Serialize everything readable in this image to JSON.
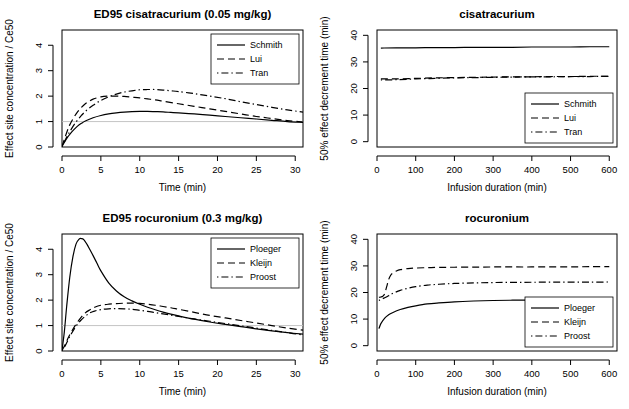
{
  "figure": {
    "width": 629,
    "height": 409,
    "background": "#ffffff",
    "ink": "#000000",
    "refline_color": "#bdbdbd"
  },
  "chart_data": [
    {
      "id": "cisatracurium-concentration",
      "type": "line",
      "title": "ED95 cisatracurium (0.05 mg/kg)",
      "xlabel": "Time (min)",
      "ylabel": "Effect site concentration / Ce50",
      "xlim": [
        0,
        31
      ],
      "ylim": [
        0,
        4.6
      ],
      "xticks": [
        0,
        5,
        10,
        15,
        20,
        25,
        30
      ],
      "yticks": [
        0,
        1,
        2,
        3,
        4
      ],
      "grid": false,
      "reference_line_y": 1,
      "legend_position": "top-right",
      "series": [
        {
          "name": "Schmith",
          "dash": "solid",
          "x": [
            0,
            0.3,
            0.7,
            1,
            1.5,
            2,
            2.5,
            3,
            4,
            5,
            6,
            7,
            8,
            9,
            10,
            11,
            12,
            13,
            14,
            15,
            17,
            19,
            21,
            23,
            25,
            27,
            29,
            31
          ],
          "y": [
            0.02,
            0.18,
            0.38,
            0.5,
            0.67,
            0.82,
            0.93,
            1.02,
            1.15,
            1.24,
            1.3,
            1.34,
            1.37,
            1.39,
            1.4,
            1.4,
            1.39,
            1.38,
            1.36,
            1.34,
            1.3,
            1.25,
            1.2,
            1.15,
            1.1,
            1.05,
            1.0,
            0.97
          ]
        },
        {
          "name": "Lui",
          "dash": "dashed",
          "x": [
            0,
            0.3,
            0.7,
            1,
            1.5,
            2,
            2.5,
            3,
            3.5,
            4,
            5,
            6,
            7,
            8,
            9,
            10,
            11,
            12,
            13,
            15,
            17,
            19,
            21,
            23,
            25,
            27,
            29,
            31
          ],
          "y": [
            0.02,
            0.3,
            0.65,
            0.87,
            1.15,
            1.38,
            1.56,
            1.7,
            1.8,
            1.88,
            1.97,
            2.0,
            2.0,
            1.99,
            1.96,
            1.93,
            1.89,
            1.85,
            1.8,
            1.7,
            1.6,
            1.5,
            1.4,
            1.3,
            1.2,
            1.12,
            1.04,
            0.98
          ]
        },
        {
          "name": "Tran",
          "dash": "dashdot",
          "x": [
            0,
            0.3,
            0.7,
            1,
            1.5,
            2,
            2.5,
            3,
            4,
            5,
            6,
            7,
            8,
            9,
            10,
            11,
            12,
            13,
            14,
            15,
            17,
            19,
            21,
            23,
            25,
            27,
            29,
            31
          ],
          "y": [
            0.02,
            0.2,
            0.45,
            0.6,
            0.85,
            1.06,
            1.24,
            1.4,
            1.64,
            1.83,
            1.97,
            2.08,
            2.16,
            2.21,
            2.25,
            2.26,
            2.26,
            2.24,
            2.21,
            2.18,
            2.1,
            2.0,
            1.9,
            1.78,
            1.67,
            1.56,
            1.46,
            1.37
          ]
        }
      ]
    },
    {
      "id": "cisatracurium-decrement",
      "type": "line",
      "title": "cisatracurium",
      "xlabel": "Infusion duration (min)",
      "ylabel": "50% effect decrement time (min)",
      "xlim": [
        0,
        620
      ],
      "ylim": [
        -2,
        42
      ],
      "xticks": [
        0,
        100,
        200,
        300,
        400,
        500,
        600
      ],
      "yticks": [
        0,
        10,
        20,
        30,
        40
      ],
      "grid": false,
      "legend_position": "bottom-right",
      "series": [
        {
          "name": "Schmith",
          "dash": "solid",
          "x": [
            10,
            50,
            100,
            150,
            200,
            250,
            300,
            350,
            400,
            450,
            500,
            550,
            600
          ],
          "y": [
            35.2,
            35.3,
            35.3,
            35.4,
            35.4,
            35.5,
            35.5,
            35.5,
            35.6,
            35.6,
            35.6,
            35.7,
            35.7
          ]
        },
        {
          "name": "Lui",
          "dash": "dashed",
          "x": [
            10,
            50,
            100,
            150,
            200,
            250,
            300,
            350,
            400,
            450,
            500,
            550,
            600
          ],
          "y": [
            23.6,
            23.6,
            23.8,
            24.0,
            24.1,
            24.2,
            24.3,
            24.4,
            24.4,
            24.5,
            24.5,
            24.6,
            24.6
          ]
        },
        {
          "name": "Tran",
          "dash": "dashdot",
          "x": [
            10,
            50,
            100,
            150,
            200,
            250,
            300,
            350,
            400,
            450,
            500,
            550,
            600
          ],
          "y": [
            23.2,
            23.3,
            23.6,
            23.8,
            24.0,
            24.1,
            24.2,
            24.3,
            24.4,
            24.4,
            24.5,
            24.5,
            24.6
          ]
        }
      ]
    },
    {
      "id": "rocuronium-concentration",
      "type": "line",
      "title": "ED95 rocuronium (0.3 mg/kg)",
      "xlabel": "Time (min)",
      "ylabel": "Effect site concentration / Ce50",
      "xlim": [
        0,
        31
      ],
      "ylim": [
        0,
        4.6
      ],
      "xticks": [
        0,
        5,
        10,
        15,
        20,
        25,
        30
      ],
      "yticks": [
        0,
        1,
        2,
        3,
        4
      ],
      "grid": false,
      "reference_line_y": 1,
      "legend_position": "top-right",
      "series": [
        {
          "name": "Ploeger",
          "dash": "solid",
          "x": [
            0,
            0.3,
            0.6,
            1,
            1.4,
            1.8,
            2.2,
            2.5,
            2.8,
            3.2,
            3.6,
            4,
            4.5,
            5,
            6,
            7,
            8,
            9,
            10,
            11,
            12,
            13,
            14,
            15,
            17,
            19,
            21,
            23,
            25,
            27,
            29,
            31
          ],
          "y": [
            0.02,
            0.75,
            1.75,
            2.9,
            3.7,
            4.2,
            4.4,
            4.42,
            4.38,
            4.2,
            3.98,
            3.75,
            3.45,
            3.15,
            2.68,
            2.36,
            2.13,
            1.97,
            1.84,
            1.72,
            1.62,
            1.53,
            1.45,
            1.38,
            1.25,
            1.14,
            1.05,
            0.96,
            0.87,
            0.79,
            0.72,
            0.66
          ]
        },
        {
          "name": "Kleijn",
          "dash": "dashed",
          "x": [
            0,
            0.4,
            0.8,
            1.2,
            1.8,
            2.4,
            3,
            3.6,
            4.2,
            5,
            6,
            7,
            8,
            9,
            10,
            11,
            12,
            13,
            14,
            15,
            17,
            19,
            21,
            23,
            25,
            27,
            29,
            31
          ],
          "y": [
            0.02,
            0.25,
            0.52,
            0.75,
            1.05,
            1.3,
            1.5,
            1.62,
            1.72,
            1.8,
            1.84,
            1.86,
            1.88,
            1.88,
            1.87,
            1.84,
            1.8,
            1.75,
            1.7,
            1.64,
            1.52,
            1.4,
            1.3,
            1.2,
            1.1,
            1.0,
            0.9,
            0.82
          ]
        },
        {
          "name": "Proost",
          "dash": "dashdot",
          "x": [
            0,
            0.4,
            0.8,
            1.2,
            1.8,
            2.4,
            3,
            3.6,
            4.2,
            5,
            6,
            7,
            8,
            9,
            10,
            11,
            12,
            13,
            14,
            15,
            17,
            19,
            21,
            23,
            25,
            27,
            29,
            31
          ],
          "y": [
            0.02,
            0.2,
            0.45,
            0.68,
            0.97,
            1.2,
            1.37,
            1.5,
            1.57,
            1.63,
            1.66,
            1.67,
            1.66,
            1.64,
            1.6,
            1.56,
            1.51,
            1.46,
            1.41,
            1.36,
            1.26,
            1.17,
            1.08,
            0.99,
            0.9,
            0.81,
            0.72,
            0.63
          ]
        }
      ]
    },
    {
      "id": "rocuronium-decrement",
      "type": "line",
      "title": "rocuronium",
      "xlabel": "Infusion duration (min)",
      "ylabel": "50% effect decrement time (min)",
      "xlim": [
        0,
        620
      ],
      "ylim": [
        -2,
        42
      ],
      "xticks": [
        0,
        100,
        200,
        300,
        400,
        500,
        600
      ],
      "yticks": [
        0,
        10,
        20,
        30,
        40
      ],
      "grid": false,
      "legend_position": "bottom-right",
      "series": [
        {
          "name": "Ploeger",
          "dash": "solid",
          "x": [
            5,
            10,
            20,
            30,
            40,
            60,
            80,
            100,
            130,
            160,
            200,
            250,
            300,
            350,
            400,
            450,
            500,
            550,
            600
          ],
          "y": [
            6.4,
            8.3,
            10.4,
            11.6,
            12.4,
            13.6,
            14.4,
            15.0,
            15.7,
            16.1,
            16.5,
            16.8,
            17.0,
            17.1,
            17.15,
            17.2,
            17.2,
            17.25,
            17.3
          ]
        },
        {
          "name": "Kleijn",
          "dash": "dashed",
          "x": [
            5,
            10,
            15,
            20,
            25,
            30,
            35,
            40,
            50,
            60,
            80,
            100,
            130,
            160,
            200,
            250,
            300,
            350,
            400,
            450,
            500,
            550,
            600
          ],
          "y": [
            18.2,
            18.3,
            18.6,
            19.6,
            22.2,
            24.8,
            26.4,
            27.2,
            28.1,
            28.6,
            29.0,
            29.2,
            29.35,
            29.45,
            29.5,
            29.55,
            29.6,
            29.6,
            29.6,
            29.65,
            29.65,
            29.7,
            29.7
          ]
        },
        {
          "name": "Proost",
          "dash": "dashdot",
          "x": [
            5,
            10,
            20,
            30,
            40,
            60,
            80,
            100,
            130,
            160,
            200,
            250,
            300,
            350,
            400,
            450,
            500,
            550,
            600
          ],
          "y": [
            17.0,
            17.4,
            18.0,
            18.8,
            19.6,
            20.8,
            21.6,
            22.2,
            22.8,
            23.1,
            23.4,
            23.6,
            23.75,
            23.8,
            23.85,
            23.9,
            23.9,
            23.9,
            23.95
          ]
        }
      ]
    }
  ]
}
